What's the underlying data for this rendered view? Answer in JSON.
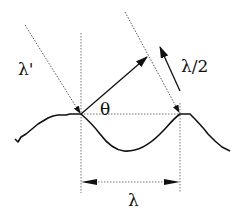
{
  "diagram": {
    "labels": {
      "incident_wavelength": "λ'",
      "angle": "θ",
      "half_wavelength": "λ/2",
      "wavelength": "λ"
    },
    "colors": {
      "line": "#111111",
      "dotted": "#555555",
      "background": "#ffffff"
    }
  }
}
